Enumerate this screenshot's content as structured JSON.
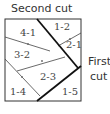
{
  "labels": {
    "second_cut": "Second cut",
    "first_cut_line1": "First",
    "first_cut_line2": "cut"
  },
  "pieces": [
    {
      "id": "4-1",
      "label": "4-1"
    },
    {
      "id": "1-2",
      "label": "1-2"
    },
    {
      "id": "2-1",
      "label": "2-1"
    },
    {
      "id": "3-2",
      "label": "3-2"
    },
    {
      "id": "2-3",
      "label": "2-3"
    },
    {
      "id": "1-4",
      "label": "1-4"
    },
    {
      "id": "1-5",
      "label": "1-5"
    }
  ],
  "colors": {
    "stroke": "#222222",
    "text": "#444444",
    "background": "#ffffff"
  }
}
